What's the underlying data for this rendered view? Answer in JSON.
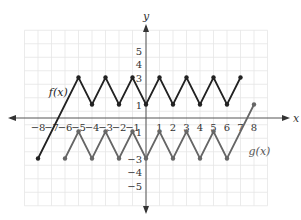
{
  "chart_data": {
    "type": "line",
    "title": "",
    "xlabel": "x",
    "ylabel": "y",
    "xlim": [
      -9,
      9
    ],
    "ylim": [
      -6.5,
      6.5
    ],
    "grid": true,
    "x_ticks": [
      -8,
      -7,
      -6,
      -5,
      -4,
      -3,
      -2,
      -1,
      1,
      2,
      3,
      4,
      5,
      6,
      7,
      8
    ],
    "y_ticks": [
      -5,
      -4,
      -3,
      -1,
      1,
      3,
      4,
      5
    ],
    "x_tick_labels": [
      "−8",
      "−7",
      "−6",
      "−5",
      "−4",
      "−3",
      "−2",
      "−1",
      "1",
      "2",
      "3",
      "4",
      "5",
      "6",
      "7",
      "8"
    ],
    "y_tick_labels": [
      "−5",
      "−4",
      "−3",
      "1",
      "1",
      "3",
      "4",
      "5"
    ],
    "series": [
      {
        "name": "f(x)",
        "color": "#222222",
        "points": [
          [
            -8,
            -3
          ],
          [
            -5,
            3
          ],
          [
            -4,
            1
          ],
          [
            -3,
            3
          ],
          [
            -2,
            1
          ],
          [
            -1,
            3
          ],
          [
            0,
            1
          ],
          [
            1,
            3
          ],
          [
            2,
            1
          ],
          [
            3,
            3
          ],
          [
            4,
            1
          ],
          [
            5,
            3
          ],
          [
            6,
            1
          ],
          [
            7,
            3
          ]
        ],
        "label_pos": [
          -6.9,
          1.8
        ]
      },
      {
        "name": "g(x)",
        "color": "#666666",
        "points": [
          [
            -6,
            -3
          ],
          [
            -5,
            -1
          ],
          [
            -4,
            -3
          ],
          [
            -3,
            -1
          ],
          [
            -2,
            -3
          ],
          [
            -1,
            -1
          ],
          [
            0,
            -3
          ],
          [
            1,
            -1
          ],
          [
            2,
            -3
          ],
          [
            3,
            -1
          ],
          [
            4,
            -3
          ],
          [
            5,
            -1
          ],
          [
            6,
            -3
          ],
          [
            8,
            1
          ]
        ],
        "label_pos": [
          7.3,
          -2.6
        ]
      }
    ]
  },
  "labels": {
    "x_axis": "x",
    "y_axis": "y",
    "f": "f(x)",
    "g": "g(x)"
  }
}
